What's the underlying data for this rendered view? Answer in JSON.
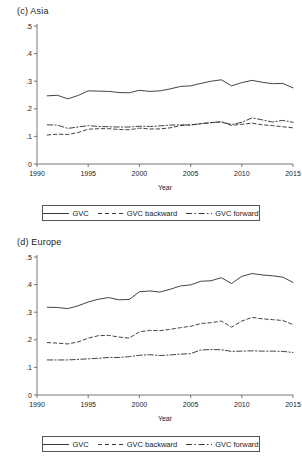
{
  "figure": {
    "background": "#ffffff",
    "line_color": "#3a3a3a",
    "axis_color": "#555555"
  },
  "panels": [
    {
      "id": "asia",
      "title": "(c)  Asia",
      "legend": [
        {
          "label": "GVC",
          "style": "solid"
        },
        {
          "label": "GVC backward",
          "style": "dashed"
        },
        {
          "label": "GVC forward",
          "style": "dashdot"
        }
      ],
      "chart_data": {
        "type": "line",
        "title": "(c)  Asia",
        "xlabel": "Year",
        "ylabel": "",
        "xlim": [
          1990,
          2015
        ],
        "ylim": [
          0,
          0.5
        ],
        "xticks": [
          1990,
          1995,
          2000,
          2005,
          2010,
          2015
        ],
        "xticklabels": [
          "1990",
          "1995",
          "2000",
          "2005",
          "2010",
          "2015"
        ],
        "yticks": [
          0,
          0.1,
          0.2,
          0.3,
          0.4,
          0.5
        ],
        "yticklabels": [
          "0",
          ".1",
          ".2",
          ".3",
          ".4",
          ".5"
        ],
        "grid": false,
        "legend_position": "below",
        "x": [
          1991,
          1992,
          1993,
          1994,
          1995,
          1996,
          1997,
          1998,
          1999,
          2000,
          2001,
          2002,
          2003,
          2004,
          2005,
          2006,
          2007,
          2008,
          2009,
          2010,
          2011,
          2012,
          2013,
          2014,
          2015
        ],
        "series": [
          {
            "name": "GVC",
            "style": "solid",
            "values": [
              0.247,
              0.249,
              0.236,
              0.248,
              0.265,
              0.264,
              0.263,
              0.259,
              0.258,
              0.267,
              0.263,
              0.265,
              0.272,
              0.281,
              0.283,
              0.292,
              0.3,
              0.305,
              0.283,
              0.295,
              0.303,
              0.296,
              0.291,
              0.292,
              0.276
            ]
          },
          {
            "name": "GVC backward",
            "style": "dashed",
            "values": [
              0.105,
              0.108,
              0.107,
              0.114,
              0.126,
              0.128,
              0.128,
              0.125,
              0.124,
              0.13,
              0.127,
              0.127,
              0.131,
              0.139,
              0.142,
              0.146,
              0.15,
              0.152,
              0.14,
              0.144,
              0.148,
              0.142,
              0.139,
              0.135,
              0.131
            ]
          },
          {
            "name": "GVC forward",
            "style": "dashdot",
            "values": [
              0.142,
              0.141,
              0.129,
              0.134,
              0.139,
              0.136,
              0.135,
              0.134,
              0.134,
              0.137,
              0.136,
              0.138,
              0.141,
              0.142,
              0.141,
              0.146,
              0.15,
              0.153,
              0.143,
              0.151,
              0.167,
              0.16,
              0.152,
              0.158,
              0.151
            ]
          }
        ]
      }
    },
    {
      "id": "europe",
      "title": "(d)  Europe",
      "legend": [
        {
          "label": "GVC",
          "style": "solid"
        },
        {
          "label": "GVC backward",
          "style": "dashed"
        },
        {
          "label": "GVC forward",
          "style": "dashdot"
        }
      ],
      "chart_data": {
        "type": "line",
        "title": "(d)  Europe",
        "xlabel": "Year",
        "ylabel": "",
        "xlim": [
          1990,
          2015
        ],
        "ylim": [
          0,
          0.5
        ],
        "xticks": [
          1990,
          1995,
          2000,
          2005,
          2010,
          2015
        ],
        "xticklabels": [
          "1990",
          "1995",
          "2000",
          "2005",
          "2010",
          "2015"
        ],
        "yticks": [
          0,
          0.1,
          0.2,
          0.3,
          0.4,
          0.5
        ],
        "yticklabels": [
          "0",
          ".1",
          ".2",
          ".3",
          ".4",
          ".5"
        ],
        "grid": false,
        "legend_position": "below",
        "x": [
          1991,
          1992,
          1993,
          1994,
          1995,
          1996,
          1997,
          1998,
          1999,
          2000,
          2001,
          2002,
          2003,
          2004,
          2005,
          2006,
          2007,
          2008,
          2009,
          2010,
          2011,
          2012,
          2013,
          2014,
          2015
        ],
        "series": [
          {
            "name": "GVC",
            "style": "solid",
            "values": [
              0.318,
              0.317,
              0.313,
              0.323,
              0.337,
              0.347,
              0.353,
              0.345,
              0.346,
              0.374,
              0.377,
              0.373,
              0.383,
              0.395,
              0.399,
              0.412,
              0.414,
              0.425,
              0.404,
              0.43,
              0.44,
              0.435,
              0.432,
              0.427,
              0.408
            ]
          },
          {
            "name": "GVC backward",
            "style": "dashed",
            "values": [
              0.19,
              0.188,
              0.185,
              0.192,
              0.206,
              0.215,
              0.216,
              0.21,
              0.206,
              0.229,
              0.234,
              0.233,
              0.238,
              0.244,
              0.249,
              0.259,
              0.262,
              0.268,
              0.246,
              0.268,
              0.281,
              0.276,
              0.273,
              0.27,
              0.255
            ]
          },
          {
            "name": "GVC forward",
            "style": "dashdot",
            "values": [
              0.127,
              0.127,
              0.127,
              0.129,
              0.131,
              0.133,
              0.136,
              0.136,
              0.139,
              0.144,
              0.146,
              0.143,
              0.145,
              0.148,
              0.15,
              0.163,
              0.165,
              0.164,
              0.158,
              0.159,
              0.16,
              0.159,
              0.159,
              0.158,
              0.154
            ]
          }
        ]
      }
    }
  ]
}
